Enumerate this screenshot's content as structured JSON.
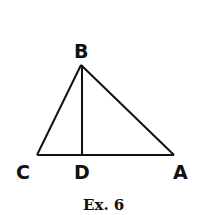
{
  "figure": {
    "caption": "Ex. 6",
    "points": {
      "A": {
        "label": "A",
        "x": 174,
        "y": 155
      },
      "B": {
        "label": "B",
        "x": 81,
        "y": 65
      },
      "C": {
        "label": "C",
        "x": 37,
        "y": 155
      },
      "D": {
        "label": "D",
        "x": 82,
        "y": 155
      }
    },
    "segments": [
      "BC",
      "BA",
      "CA",
      "BD"
    ],
    "stroke_color": "#111111"
  }
}
